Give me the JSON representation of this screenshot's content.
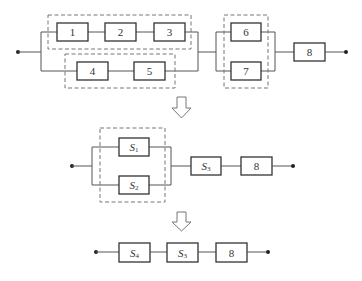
{
  "diagram": {
    "type": "reliability-block-diagram",
    "stage1": {
      "blocks": [
        {
          "id": "b1",
          "label": "1"
        },
        {
          "id": "b2",
          "label": "2"
        },
        {
          "id": "b3",
          "label": "3"
        },
        {
          "id": "b4",
          "label": "4"
        },
        {
          "id": "b5",
          "label": "5"
        },
        {
          "id": "b6",
          "label": "6"
        },
        {
          "id": "b7",
          "label": "7"
        },
        {
          "id": "b8",
          "label": "8"
        }
      ],
      "structure": "parallel(series(1,2,3), series(4,5)) -> parallel(6,7) -> 8",
      "groups": [
        {
          "name": "group-123",
          "members": [
            "1",
            "2",
            "3"
          ]
        },
        {
          "name": "group-45",
          "members": [
            "4",
            "5"
          ]
        },
        {
          "name": "group-67",
          "members": [
            "6",
            "7"
          ]
        }
      ]
    },
    "stage2": {
      "blocks": [
        {
          "id": "s1",
          "main": "S",
          "sub": "1"
        },
        {
          "id": "s2",
          "main": "S",
          "sub": "2"
        },
        {
          "id": "s3",
          "main": "S",
          "sub": "3"
        },
        {
          "id": "b8",
          "label": "8"
        }
      ],
      "structure": "parallel(S1, S2) -> S3 -> 8"
    },
    "stage3": {
      "blocks": [
        {
          "id": "s4",
          "main": "S",
          "sub": "4"
        },
        {
          "id": "s3",
          "main": "S",
          "sub": "3"
        },
        {
          "id": "b8",
          "label": "8"
        }
      ],
      "structure": "S4 -> S3 -> 8"
    },
    "arrows": [
      "down-arrow",
      "down-arrow"
    ]
  }
}
